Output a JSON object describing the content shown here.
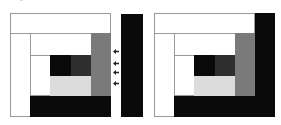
{
  "figure": {
    "colors": {
      "white": "#ffffff",
      "black": "#0a0a0a",
      "dark_gray": "#2e2e2e",
      "mid_gray": "#7a7a7a",
      "light_gray": "#dcdcdc",
      "outline": "#9a9a9a"
    },
    "left_panel": {
      "arrow_count": 4,
      "separate_bar": "black-vertical-bar"
    },
    "right_panel": {
      "attached_bar": "black-L-shape"
    },
    "arrows": [
      {
        "y": 49
      },
      {
        "y": 61
      },
      {
        "y": 70
      },
      {
        "y": 81
      }
    ]
  }
}
